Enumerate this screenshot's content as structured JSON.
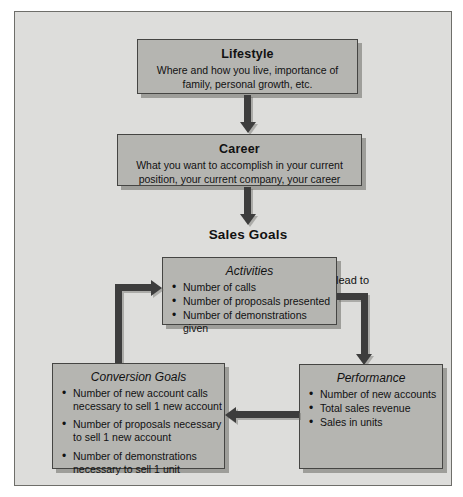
{
  "diagram": {
    "boxes": {
      "lifestyle": {
        "title": "Lifestyle",
        "body": "Where and how you live, importance of family, personal growth, etc."
      },
      "career": {
        "title": "Career",
        "body": "What you want to accomplish in your current position, your current company, your career"
      },
      "activities": {
        "title": "Activities",
        "bullets": [
          "Number of calls",
          "Number of proposals presented",
          "Number of demonstrations given"
        ]
      },
      "conversion_goals": {
        "title": "Conversion Goals",
        "bullets": [
          "Number of new account calls necessary to sell 1 new account",
          "Number of proposals necessary to sell 1 new account",
          "Number of demonstrations necessary to sell 1 unit"
        ]
      },
      "performance": {
        "title": "Performance",
        "bullets": [
          "Number of new accounts",
          "Total sales revenue",
          "Sales in units"
        ]
      }
    },
    "labels": {
      "sales_goals": "Sales Goals",
      "lead_to": "lead to"
    },
    "colors": {
      "frame_bg": "#dddddb",
      "box_fill": "#b5b5b1",
      "box_border": "#454543",
      "shadow": "#9e9e9a",
      "arrow": "#3d3d3d",
      "text": "#111111",
      "page_bg": "#ffffff"
    }
  }
}
